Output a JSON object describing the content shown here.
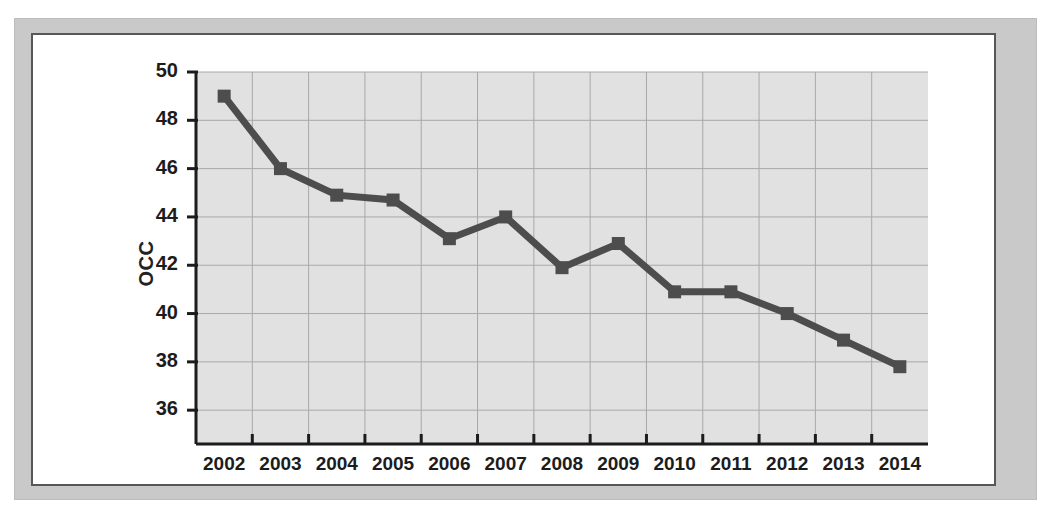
{
  "figure": {
    "frame_color": "#c9c9c9",
    "page_color": "#ffffff",
    "border_color": "#575757"
  },
  "chart_data": {
    "type": "line",
    "title": "",
    "subtitle": "",
    "xlabel": "",
    "ylabel": "OCC",
    "categories": [
      "2002",
      "2003",
      "2004",
      "2005",
      "2006",
      "2007",
      "2008",
      "2009",
      "2010",
      "2011",
      "2012",
      "2013",
      "2014"
    ],
    "x": [
      2002,
      2003,
      2004,
      2005,
      2006,
      2007,
      2008,
      2009,
      2010,
      2011,
      2012,
      2013,
      2014
    ],
    "values": [
      49.0,
      46.0,
      44.9,
      44.7,
      43.1,
      44.0,
      41.9,
      42.9,
      40.9,
      40.9,
      40.0,
      38.9,
      37.8
    ],
    "series": [
      {
        "name": "OCC",
        "values": [
          49.0,
          46.0,
          44.9,
          44.7,
          43.1,
          44.0,
          41.9,
          42.9,
          40.9,
          40.9,
          40.0,
          38.9,
          37.8
        ],
        "color": "#4d4d4d",
        "marker": "square",
        "line_width": 7
      }
    ],
    "ylim": [
      34.6,
      50.0
    ],
    "ytick_labels": [
      "50",
      "48",
      "46",
      "44",
      "42",
      "40",
      "38",
      "36"
    ],
    "ytick_values": [
      50,
      48,
      46,
      44,
      42,
      40,
      38,
      36
    ],
    "xtick_labels": [
      "2002",
      "2003",
      "2004",
      "2005",
      "2006",
      "2007",
      "2008",
      "2009",
      "2010",
      "2011",
      "2012",
      "2013",
      "2014"
    ],
    "grid": true,
    "grid_color": "#a8a8a8",
    "plot_bg": "#e1e1e1",
    "legend": "none",
    "legend_position": "none",
    "annotations": []
  }
}
